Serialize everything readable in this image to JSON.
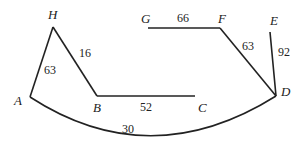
{
  "diagram": {
    "nodes": [
      {
        "id": "H",
        "label": "H",
        "x": 53,
        "y": 27
      },
      {
        "id": "A",
        "label": "A",
        "x": 30,
        "y": 97
      },
      {
        "id": "B",
        "label": "B",
        "x": 97,
        "y": 96
      },
      {
        "id": "C",
        "label": "C",
        "x": 195,
        "y": 96
      },
      {
        "id": "G",
        "label": "G",
        "x": 148,
        "y": 28
      },
      {
        "id": "F",
        "label": "F",
        "x": 220,
        "y": 28
      },
      {
        "id": "E",
        "label": "E",
        "x": 270,
        "y": 32
      },
      {
        "id": "D",
        "label": "D",
        "x": 276,
        "y": 96
      }
    ],
    "edges": [
      {
        "from": "A",
        "to": "H",
        "weight": "63"
      },
      {
        "from": "H",
        "to": "B",
        "weight": "16"
      },
      {
        "from": "B",
        "to": "C",
        "weight": "52"
      },
      {
        "from": "G",
        "to": "F",
        "weight": "66"
      },
      {
        "from": "F",
        "to": "D",
        "weight": "63"
      },
      {
        "from": "E",
        "to": "D",
        "weight": "92"
      },
      {
        "from": "A",
        "to": "D",
        "weight": "30",
        "curved": true
      }
    ],
    "stroke_color": "#222222"
  }
}
